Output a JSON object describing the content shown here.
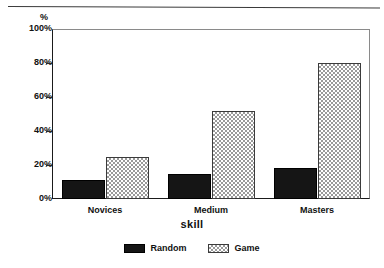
{
  "chart_data": {
    "type": "bar",
    "title": "",
    "xlabel": "skill",
    "ylabel": "%",
    "categories": [
      "Novices",
      "Medium",
      "Masters"
    ],
    "series": [
      {
        "name": "Random",
        "values": [
          11,
          15,
          18
        ],
        "color": "#151515",
        "pattern": "solid-black"
      },
      {
        "name": "Game",
        "values": [
          25,
          52,
          80
        ],
        "color": "#9a9a9a",
        "pattern": "checkered-gray"
      }
    ],
    "ylim": [
      0,
      100
    ],
    "yticks": [
      0,
      20,
      40,
      60,
      80,
      100
    ],
    "ytick_labels": [
      "0%",
      "20%",
      "40%",
      "60%",
      "80%",
      "100%"
    ],
    "grid": false,
    "legend_position": "bottom-center"
  },
  "axes": {
    "y_unit_label": "%",
    "x_axis_title": "skill"
  },
  "legend": {
    "items": [
      {
        "label": "Random",
        "swatch": "black-swatch-icon"
      },
      {
        "label": "Game",
        "swatch": "checkered-swatch-icon"
      }
    ]
  }
}
